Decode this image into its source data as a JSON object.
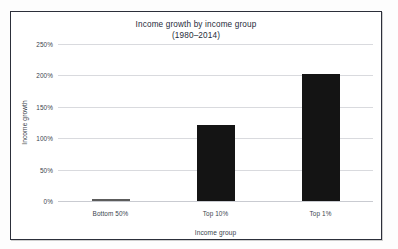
{
  "figure": {
    "frame_border_color": "#2c2f3a",
    "background_color": "#ffffff"
  },
  "chart_data": {
    "type": "bar",
    "title": "Income growth by income group",
    "subtitle": "(1980–2014)",
    "xlabel": "Income group",
    "ylabel": "Income growth",
    "categories": [
      "Bottom 50%",
      "Top 10%",
      "Top 1%"
    ],
    "values": [
      2,
      121,
      202
    ],
    "value_labels": [
      "2%",
      "121%",
      "202%"
    ],
    "ylim": [
      0,
      250
    ],
    "yticks": [
      0,
      50,
      100,
      150,
      200,
      250
    ],
    "ytick_labels": [
      "0%",
      "50%",
      "100%",
      "150%",
      "200%",
      "250%"
    ],
    "grid": true,
    "grid_axis": "y",
    "legend": false,
    "legend_position": "none",
    "bar_color": "#141414",
    "grid_color": "#d9dade",
    "text_color": "#3a3f4d"
  }
}
